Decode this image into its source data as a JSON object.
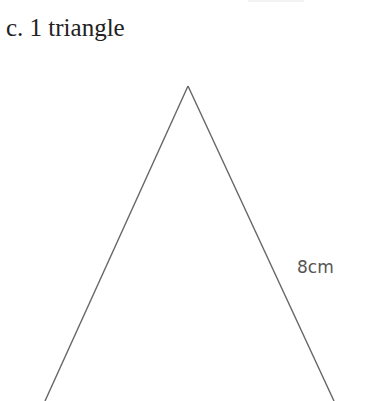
{
  "caption": "c. 1 triangle",
  "triangle": {
    "side_label": "8cm",
    "line_color": "#666666"
  }
}
